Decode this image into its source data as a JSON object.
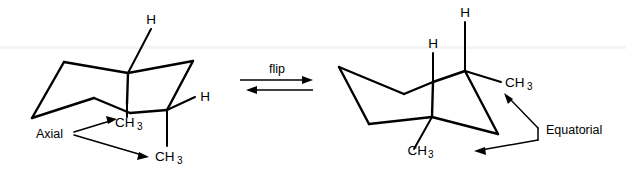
{
  "figure": {
    "background_color": "#ffffff",
    "line_color": "#000000",
    "width": 626,
    "height": 175
  },
  "reaction": {
    "label": "flip",
    "arrow_forward": "right-arrow",
    "arrow_reverse": "left-arrow",
    "type": "equilibrium"
  },
  "left_structure": {
    "name": "axial-conformer",
    "substituent_labels": {
      "h_top": "H",
      "h_right": "H",
      "methyl_upper": "CH",
      "methyl_upper_sub": "3",
      "methyl_lower": "CH",
      "methyl_lower_sub": "3"
    },
    "callout": {
      "label": "Axial",
      "targets": [
        "methyl_upper",
        "methyl_lower"
      ]
    }
  },
  "right_structure": {
    "name": "equatorial-conformer",
    "substituent_labels": {
      "h_top": "H",
      "h_left": "H",
      "methyl_right": "CH",
      "methyl_right_sub": "3",
      "methyl_lower": "CH",
      "methyl_lower_sub": "3"
    },
    "callout": {
      "label": "Equatorial",
      "targets": [
        "methyl_right",
        "methyl_lower"
      ]
    }
  }
}
